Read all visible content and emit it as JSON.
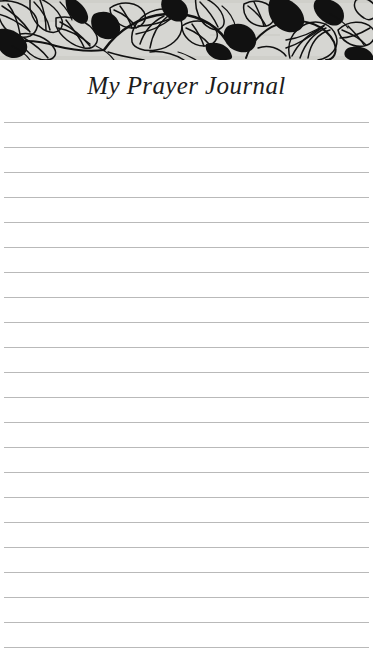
{
  "document": {
    "type": "printable-journal-page",
    "title": "My Prayer Journal",
    "page_width": 373,
    "page_height": 669,
    "background_color": "#ffffff"
  },
  "banner": {
    "name": "botanical-line-art-banner",
    "description": "Black ink line-art of leaves, vines and flowers on a light gray ground",
    "background_color": "#d6d6d2",
    "ink_color": "#111111",
    "height": 60
  },
  "header": {
    "title": "My Prayer Journal",
    "title_color": "#1c1c1c",
    "title_style": "italic-serif"
  },
  "lines": {
    "name": "ruled-writing-lines",
    "count": 22,
    "first_y": 122,
    "spacing": 25,
    "color": "#b9b9b9",
    "left": 4,
    "width": 365,
    "positions": [
      122,
      147,
      172,
      197,
      222,
      247,
      272,
      297,
      322,
      347,
      372,
      397,
      422,
      447,
      472,
      497,
      522,
      547,
      572,
      597,
      622,
      647
    ]
  }
}
